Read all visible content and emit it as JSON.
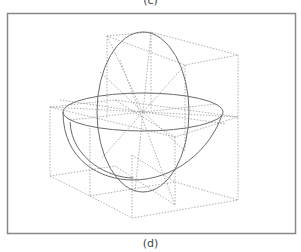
{
  "captions": {
    "top": "(c)",
    "bottom": "(d)"
  },
  "colors": {
    "frame": "#888888",
    "dotted": "#9a9a9a",
    "curve": "#6a6a6a",
    "background": "#ffffff"
  },
  "diagram": {
    "frame": {
      "x": 7,
      "y": 13,
      "width": 288,
      "height": 220
    },
    "center": [
      143,
      112
    ]
  }
}
